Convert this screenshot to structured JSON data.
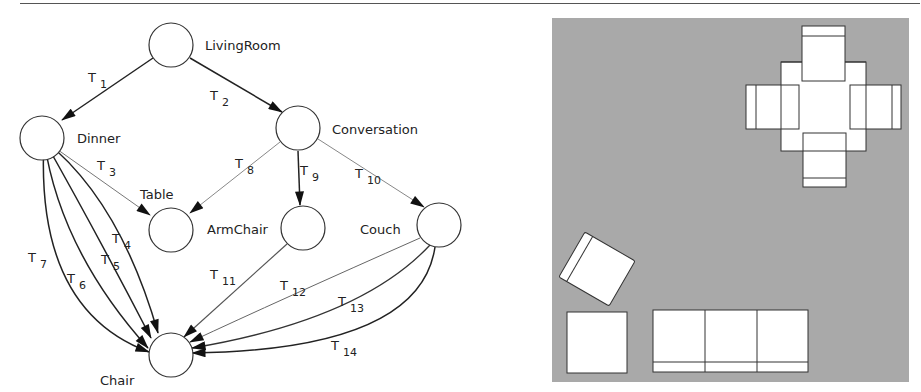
{
  "diagram": {
    "nodes": [
      {
        "id": "livingroom",
        "label": "LivingRoom",
        "cx": 171,
        "cy": 45,
        "lx": 205,
        "ly": 50
      },
      {
        "id": "dinner",
        "label": "Dinner",
        "cx": 42,
        "cy": 138,
        "lx": 77,
        "ly": 143
      },
      {
        "id": "conversation",
        "label": "Conversation",
        "cx": 298,
        "cy": 128,
        "lx": 332,
        "ly": 134
      },
      {
        "id": "table",
        "label": "Table",
        "cx": 171,
        "cy": 230,
        "lx": 140,
        "ly": 199
      },
      {
        "id": "armchair",
        "label": "ArmChair",
        "cx": 303,
        "cy": 228,
        "lx": 207,
        "ly": 234
      },
      {
        "id": "couch",
        "label": "Couch",
        "cx": 439,
        "cy": 225,
        "lx": 360,
        "ly": 234
      },
      {
        "id": "chair",
        "label": "Chair",
        "cx": 171,
        "cy": 355,
        "lx": 100,
        "ly": 385
      }
    ],
    "edges": [
      {
        "id": "T1",
        "t": "T",
        "sub": "1",
        "tx": 88,
        "ty": 82
      },
      {
        "id": "T2",
        "t": "T",
        "sub": "2",
        "tx": 210,
        "ty": 100
      },
      {
        "id": "T3",
        "t": "T",
        "sub": "3",
        "tx": 97,
        "ty": 170
      },
      {
        "id": "T4",
        "t": "T",
        "sub": "4",
        "tx": 112,
        "ty": 243
      },
      {
        "id": "T5",
        "t": "T",
        "sub": "5",
        "tx": 101,
        "ty": 264
      },
      {
        "id": "T6",
        "t": "T",
        "sub": "6",
        "tx": 67,
        "ty": 283
      },
      {
        "id": "T7",
        "t": "T",
        "sub": "7",
        "tx": 28,
        "ty": 262
      },
      {
        "id": "T8",
        "t": "T",
        "sub": "8",
        "tx": 235,
        "ty": 168
      },
      {
        "id": "T9",
        "t": "T",
        "sub": "9",
        "tx": 300,
        "ty": 175
      },
      {
        "id": "T10",
        "t": "T",
        "sub": "10",
        "tx": 355,
        "ty": 178
      },
      {
        "id": "T11",
        "t": "T",
        "sub": "11",
        "tx": 210,
        "ty": 279
      },
      {
        "id": "T12",
        "t": "T",
        "sub": "12",
        "tx": 280,
        "ty": 290
      },
      {
        "id": "T13",
        "t": "T",
        "sub": "13",
        "tx": 338,
        "ty": 306
      },
      {
        "id": "T14",
        "t": "T",
        "sub": "14",
        "tx": 331,
        "ty": 350
      }
    ]
  },
  "floorplan": {
    "background": "#a9a9a9",
    "items": [
      "dining-table",
      "dining-chair-top",
      "dining-chair-left",
      "dining-chair-right",
      "dining-chair-bottom",
      "armchair",
      "chair",
      "couch"
    ]
  }
}
